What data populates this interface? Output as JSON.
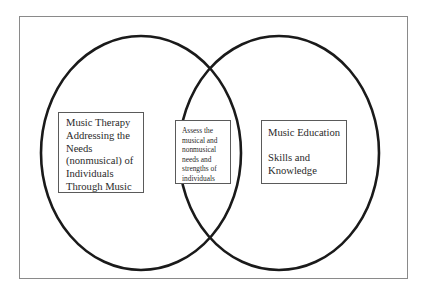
{
  "diagram": {
    "type": "venn",
    "colors": {
      "background": "#ffffff",
      "circle_stroke": "#1a1a1a",
      "frame_stroke": "#8a8a8a",
      "box_stroke": "#5a5a5a",
      "text": "#2a2a2a"
    },
    "left_set": {
      "label_lines": [
        "Music Therapy",
        "Addressing the",
        "Needs",
        "(nonmusical) of",
        "Individuals",
        "Through Music"
      ]
    },
    "intersection": {
      "label_lines": [
        "Assess the",
        "musical and",
        "nonmusical",
        "needs and",
        "strengths of",
        "individuals"
      ]
    },
    "right_set": {
      "title": "Music Education",
      "label_lines": [
        "Skills and",
        "Knowledge"
      ]
    }
  }
}
